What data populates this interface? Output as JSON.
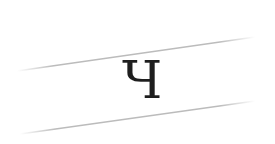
{
  "captcha": {
    "character": "Ч",
    "text_color": "#1e1e1e",
    "background_color": "#ffffff",
    "line_color": "#b4b4b4",
    "lines": [
      {
        "x1": 17,
        "y1": 71,
        "x2": 255,
        "y2": 37
      },
      {
        "x1": 20,
        "y1": 134,
        "x2": 255,
        "y2": 101
      }
    ]
  }
}
